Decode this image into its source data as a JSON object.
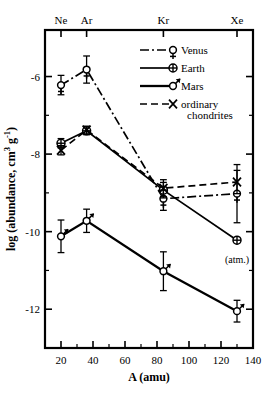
{
  "chart_data": {
    "type": "line",
    "title": "",
    "xlabel": "A (amu)",
    "ylabel": "log (abundance, cm3 g-1)",
    "ylabel_parts": {
      "main": "log (abundance, cm",
      "sup1": "3",
      "mid": " g",
      "sup2": "-1",
      "end": ")"
    },
    "xlim": [
      10,
      140
    ],
    "ylim": [
      -13.0,
      -4.8
    ],
    "grid": false,
    "legend_position": "top-right",
    "x_ticks": [
      20,
      40,
      60,
      80,
      100,
      120,
      140
    ],
    "x_tick_labels": [
      "20",
      "40",
      "60",
      "80",
      "100",
      "120",
      "140"
    ],
    "x_minor_ticks": [
      30,
      50,
      70,
      90,
      110,
      130
    ],
    "y_ticks": [
      -6,
      -8,
      -10,
      -12
    ],
    "y_tick_labels": [
      "-6",
      "-8",
      "-10",
      "-12"
    ],
    "y_minor_ticks": [
      -7,
      -9,
      -11
    ],
    "top_axis_labels": [
      {
        "label": "Ne",
        "x": 20
      },
      {
        "label": "Ar",
        "x": 36
      },
      {
        "label": "Kr",
        "x": 84
      },
      {
        "label": "Xe",
        "x": 130
      }
    ],
    "x": [
      20,
      36,
      84,
      130
    ],
    "series": [
      {
        "name": "Venus",
        "marker": "venus-symbol",
        "linestyle": "dashdot",
        "color": "#000000",
        "values": [
          -6.22,
          -5.82,
          -9.15,
          -9.02
        ],
        "errors": [
          0.25,
          0.35,
          0.3,
          0.75
        ]
      },
      {
        "name": "Earth",
        "marker": "earth-symbol",
        "linestyle": "solid",
        "color": "#000000",
        "values": [
          -7.72,
          -7.4,
          -8.93,
          -10.22
        ],
        "errors": [
          0.12,
          0.1,
          0.2,
          0.06
        ]
      },
      {
        "name": "Mars",
        "marker": "mars-symbol",
        "linestyle": "solid",
        "color": "#000000",
        "values": [
          -10.12,
          -9.72,
          -11.02,
          -12.05
        ],
        "errors": [
          0.42,
          0.3,
          0.5,
          0.28
        ]
      },
      {
        "name": "ordinary chondrites",
        "marker": "x-symbol",
        "linestyle": "dashed",
        "color": "#000000",
        "values": [
          -7.9,
          -7.38,
          -8.88,
          -8.72
        ],
        "errors": [
          0.12,
          0.1,
          0.22,
          0.3
        ]
      }
    ],
    "annotations": [
      {
        "text": "(atm.)",
        "x": 130,
        "y": -10.8,
        "for": "Earth"
      }
    ],
    "legend_entries": [
      {
        "label": "Venus",
        "marker": "venus-symbol",
        "linestyle": "dashdot"
      },
      {
        "label": "Earth",
        "marker": "earth-symbol",
        "linestyle": "solid"
      },
      {
        "label": "Mars",
        "marker": "mars-symbol",
        "linestyle": "solid"
      },
      {
        "label": "ordinary",
        "label2": "chondrites",
        "marker": "x-symbol",
        "linestyle": "dashed"
      }
    ]
  }
}
